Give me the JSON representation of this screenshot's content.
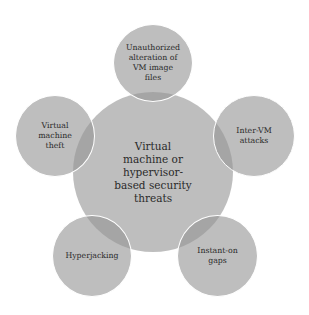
{
  "diagram": {
    "type": "hub-and-spoke",
    "center": {
      "label": "Virtual\nmachine or\nhypervisor-\nbased security\nthreats"
    },
    "nodes": [
      {
        "label": "Unauthorized\nalteration of\nVM image\nfiles"
      },
      {
        "label": "Inter-VM\nattacks"
      },
      {
        "label": "Instant-on\ngaps"
      },
      {
        "label": "Hyperjacking"
      },
      {
        "label": "Virtual\nmachine\ntheft"
      }
    ],
    "colors": {
      "circle_fill": "#b8b8b8",
      "overlap_fill": "#a3a3a3",
      "outline": "#ffffff",
      "text": "#2a2a2a",
      "background": "#ffffff"
    }
  }
}
